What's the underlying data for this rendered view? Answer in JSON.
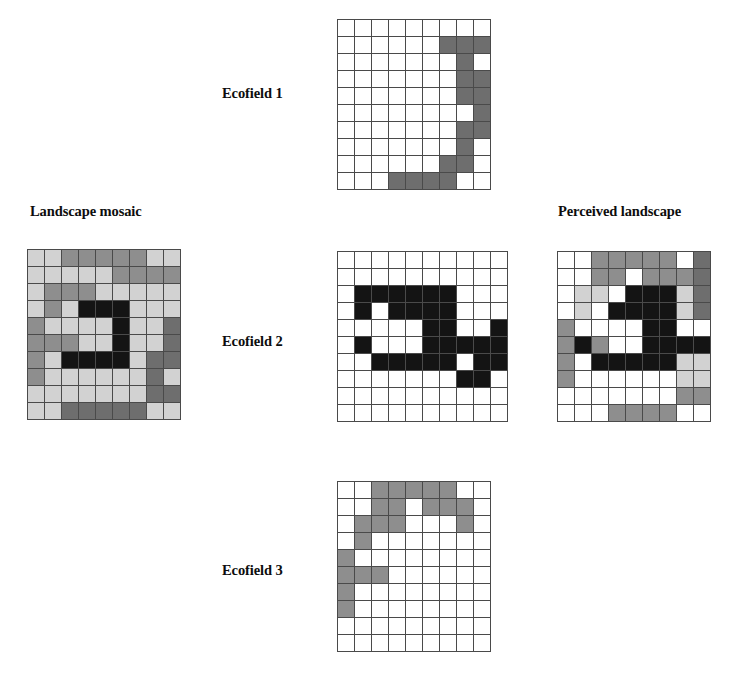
{
  "figure": {
    "background": "#ffffff",
    "width": 749,
    "height": 677
  },
  "palette": {
    "white": "#ffffff",
    "light_gray": "#d2d2d2",
    "medium_gray": "#8e8e8e",
    "dark_gray": "#6e6e6e",
    "black": "#141414",
    "grid_line": "#4a4a4a"
  },
  "panels": [
    {
      "id": "landscape-mosaic",
      "label": "Landscape mosaic",
      "label_x": 30,
      "label_y": 203,
      "grid_x": 27,
      "grid_y": 249,
      "cell": 16,
      "cols": 9,
      "rows": 10,
      "cells": [
        [
          "l",
          "l",
          "m",
          "m",
          "m",
          "m",
          "m",
          "l",
          "l"
        ],
        [
          "l",
          "l",
          "l",
          "l",
          "l",
          "m",
          "m",
          "m",
          "m"
        ],
        [
          "l",
          "m",
          "m",
          "m",
          "l",
          "l",
          "l",
          "l",
          "l"
        ],
        [
          "l",
          "m",
          "l",
          "k",
          "k",
          "k",
          "l",
          "l",
          "l"
        ],
        [
          "m",
          "l",
          "l",
          "l",
          "l",
          "k",
          "l",
          "l",
          "d"
        ],
        [
          "m",
          "m",
          "m",
          "l",
          "l",
          "k",
          "l",
          "l",
          "d"
        ],
        [
          "m",
          "l",
          "k",
          "k",
          "k",
          "k",
          "l",
          "d",
          "d"
        ],
        [
          "m",
          "l",
          "l",
          "l",
          "l",
          "l",
          "l",
          "d",
          "l"
        ],
        [
          "l",
          "l",
          "l",
          "l",
          "l",
          "l",
          "l",
          "d",
          "d"
        ],
        [
          "l",
          "l",
          "d",
          "d",
          "d",
          "d",
          "d",
          "l",
          "l"
        ]
      ]
    },
    {
      "id": "ecofield-1",
      "label": "Ecofield 1",
      "label_x": 222,
      "label_y": 85,
      "grid_x": 337,
      "grid_y": 19,
      "cell": 16,
      "cols": 9,
      "rows": 10,
      "cells": [
        [
          "w",
          "w",
          "w",
          "w",
          "w",
          "w",
          "w",
          "w",
          "w"
        ],
        [
          "w",
          "w",
          "w",
          "w",
          "w",
          "w",
          "d",
          "d",
          "d"
        ],
        [
          "w",
          "w",
          "w",
          "w",
          "w",
          "w",
          "w",
          "d",
          "w"
        ],
        [
          "w",
          "w",
          "w",
          "w",
          "w",
          "w",
          "w",
          "d",
          "d"
        ],
        [
          "w",
          "w",
          "w",
          "w",
          "w",
          "w",
          "w",
          "d",
          "d"
        ],
        [
          "w",
          "w",
          "w",
          "w",
          "w",
          "w",
          "w",
          "w",
          "d"
        ],
        [
          "w",
          "w",
          "w",
          "w",
          "w",
          "w",
          "w",
          "d",
          "d"
        ],
        [
          "w",
          "w",
          "w",
          "w",
          "w",
          "w",
          "w",
          "d",
          "w"
        ],
        [
          "w",
          "w",
          "w",
          "w",
          "w",
          "w",
          "d",
          "d",
          "w"
        ],
        [
          "w",
          "w",
          "w",
          "d",
          "d",
          "d",
          "d",
          "w",
          "w"
        ]
      ]
    },
    {
      "id": "ecofield-2",
      "label": "Ecofield 2",
      "label_x": 222,
      "label_y": 333,
      "grid_x": 337,
      "grid_y": 251,
      "cell": 16,
      "cols": 10,
      "rows": 10,
      "cells": [
        [
          "w",
          "w",
          "w",
          "w",
          "w",
          "w",
          "w",
          "w",
          "w",
          "w"
        ],
        [
          "w",
          "w",
          "w",
          "w",
          "w",
          "w",
          "w",
          "w",
          "w",
          "w"
        ],
        [
          "w",
          "k",
          "k",
          "k",
          "k",
          "k",
          "k",
          "w",
          "w",
          "w"
        ],
        [
          "w",
          "k",
          "w",
          "k",
          "k",
          "k",
          "k",
          "w",
          "w",
          "w"
        ],
        [
          "w",
          "w",
          "w",
          "w",
          "w",
          "k",
          "k",
          "w",
          "w",
          "k"
        ],
        [
          "w",
          "k",
          "w",
          "w",
          "w",
          "k",
          "k",
          "k",
          "k",
          "k"
        ],
        [
          "w",
          "w",
          "k",
          "k",
          "k",
          "k",
          "k",
          "w",
          "k",
          "k"
        ],
        [
          "w",
          "w",
          "w",
          "w",
          "w",
          "w",
          "w",
          "k",
          "k",
          "w"
        ],
        [
          "w",
          "w",
          "w",
          "w",
          "w",
          "w",
          "w",
          "w",
          "w",
          "w"
        ],
        [
          "w",
          "w",
          "w",
          "w",
          "w",
          "w",
          "w",
          "w",
          "w",
          "w"
        ]
      ]
    },
    {
      "id": "ecofield-3",
      "label": "Ecofield 3",
      "label_x": 222,
      "label_y": 562,
      "grid_x": 337,
      "grid_y": 481,
      "cell": 16,
      "cols": 9,
      "rows": 10,
      "cells": [
        [
          "w",
          "w",
          "m",
          "m",
          "m",
          "m",
          "m",
          "w",
          "w"
        ],
        [
          "w",
          "w",
          "m",
          "m",
          "w",
          "m",
          "m",
          "m",
          "w"
        ],
        [
          "w",
          "m",
          "m",
          "m",
          "w",
          "w",
          "w",
          "m",
          "w"
        ],
        [
          "w",
          "m",
          "w",
          "w",
          "w",
          "w",
          "w",
          "w",
          "w"
        ],
        [
          "m",
          "w",
          "w",
          "w",
          "w",
          "w",
          "w",
          "w",
          "w"
        ],
        [
          "m",
          "m",
          "m",
          "w",
          "w",
          "w",
          "w",
          "w",
          "w"
        ],
        [
          "m",
          "w",
          "w",
          "w",
          "w",
          "w",
          "w",
          "w",
          "w"
        ],
        [
          "m",
          "w",
          "w",
          "w",
          "w",
          "w",
          "w",
          "w",
          "w"
        ],
        [
          "w",
          "w",
          "w",
          "w",
          "w",
          "w",
          "w",
          "w",
          "w"
        ],
        [
          "w",
          "w",
          "w",
          "w",
          "w",
          "w",
          "w",
          "w",
          "w"
        ]
      ]
    },
    {
      "id": "perceived-landscape",
      "label": "Perceived landscape",
      "label_x": 558,
      "label_y": 203,
      "grid_x": 557,
      "grid_y": 251,
      "cell": 16,
      "cols": 9,
      "rows": 10,
      "cells": [
        [
          "w",
          "w",
          "m",
          "m",
          "m",
          "m",
          "m",
          "w",
          "d"
        ],
        [
          "w",
          "w",
          "m",
          "m",
          "w",
          "m",
          "m",
          "m",
          "d"
        ],
        [
          "w",
          "l",
          "l",
          "w",
          "k",
          "k",
          "k",
          "l",
          "d"
        ],
        [
          "w",
          "l",
          "w",
          "k",
          "k",
          "k",
          "k",
          "l",
          "d"
        ],
        [
          "m",
          "w",
          "w",
          "w",
          "w",
          "k",
          "k",
          "w",
          "w"
        ],
        [
          "m",
          "k",
          "m",
          "w",
          "w",
          "k",
          "k",
          "k",
          "k"
        ],
        [
          "m",
          "w",
          "k",
          "k",
          "k",
          "k",
          "k",
          "l",
          "l"
        ],
        [
          "m",
          "w",
          "w",
          "w",
          "w",
          "w",
          "w",
          "l",
          "l"
        ],
        [
          "w",
          "w",
          "w",
          "w",
          "w",
          "w",
          "w",
          "m",
          "m"
        ],
        [
          "w",
          "w",
          "w",
          "m",
          "m",
          "m",
          "m",
          "w",
          "w"
        ]
      ]
    }
  ]
}
